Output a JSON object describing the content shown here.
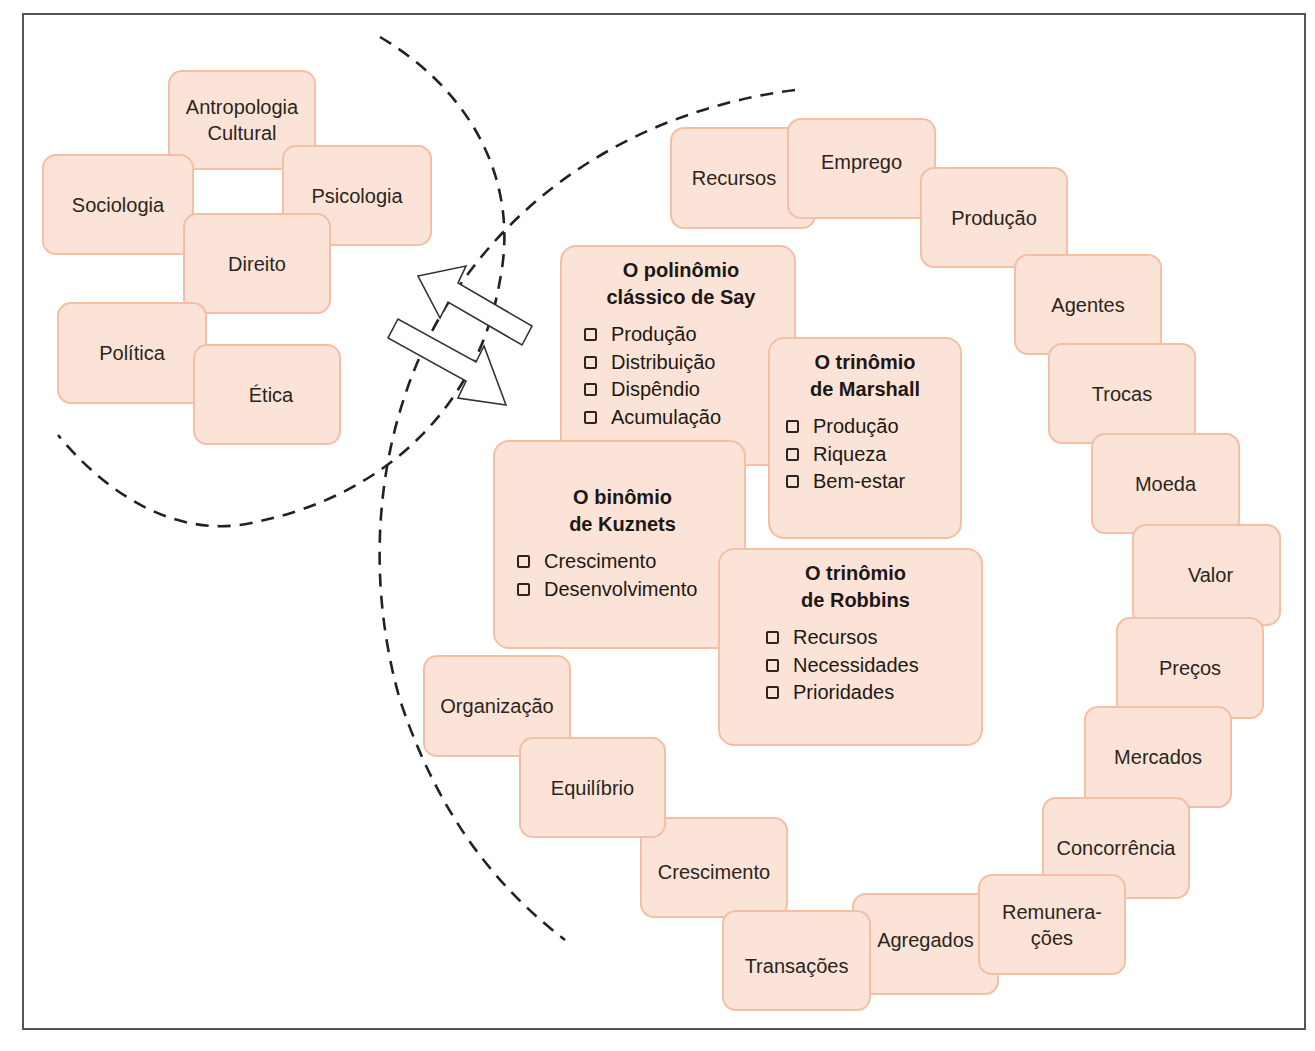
{
  "colors": {
    "box_fill": "#fbe4d7",
    "box_border": "#f4bfa2",
    "dash_line": "#222222",
    "frame": "#555555"
  },
  "outer_circle": {
    "items": [
      "Antropologia\nCultural",
      "Sociologia",
      "Psicologia",
      "Direito",
      "Política",
      "Ética"
    ]
  },
  "groups": {
    "say": {
      "title": "O polinômio\nclássico de Say",
      "items": [
        "Produção",
        "Distribuição",
        "Dispêndio",
        "Acumulação"
      ]
    },
    "marshall": {
      "title": "O trinômio\nde Marshall",
      "items": [
        "Produção",
        "Riqueza",
        "Bem-estar"
      ]
    },
    "kuznets": {
      "title": "O binômio\nde Kuznets",
      "items": [
        "Crescimento",
        "Desenvolvimento"
      ]
    },
    "robbins": {
      "title": "O trinômio\nde Robbins",
      "items": [
        "Recursos",
        "Necessidades",
        "Prioridades"
      ]
    }
  },
  "ring": {
    "items": [
      "Recursos",
      "Emprego",
      "Produção",
      "Agentes",
      "Trocas",
      "Moeda",
      "Valor",
      "Preços",
      "Mercados",
      "Concorrência",
      "Remunera-\nções",
      "Agregados",
      "Transações",
      "Crescimento",
      "Equilíbrio",
      "Organização"
    ]
  },
  "arrows": {
    "direction": "bidirectional"
  }
}
